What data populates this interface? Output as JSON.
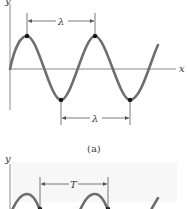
{
  "figure": {
    "panel_a": {
      "y_axis_label": "y",
      "x_axis_label": "x",
      "top_dimension_label": "λ",
      "bottom_dimension_label": "λ",
      "caption": "(a)"
    },
    "panel_b": {
      "y_axis_label": "y",
      "dimension_label": "T"
    },
    "colors": {
      "wave": "#6e6e6e",
      "axis": "#8a8a8a",
      "dot": "#111111",
      "dimension_line": "#555555"
    }
  }
}
